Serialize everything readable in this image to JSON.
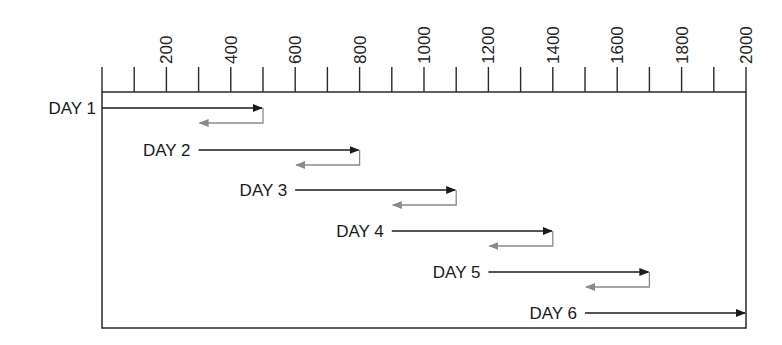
{
  "axis": {
    "min": 0,
    "max": 2000,
    "minor_step": 100,
    "labels": [
      "200",
      "400",
      "600",
      "800",
      "1000",
      "1200",
      "1400",
      "1600",
      "1800",
      "2000"
    ],
    "label_values": [
      200,
      400,
      600,
      800,
      1000,
      1200,
      1400,
      1600,
      1800,
      2000
    ]
  },
  "colors": {
    "frame": "#2a2a2a",
    "forward_arrow": "#1a1a1a",
    "return_arrow": "#8a8a8a",
    "text": "#1a1a1a"
  },
  "days": [
    {
      "label": "DAY 1",
      "start": 0,
      "end": 500,
      "return_to": 300
    },
    {
      "label": "DAY 2",
      "start": 300,
      "end": 800,
      "return_to": 600
    },
    {
      "label": "DAY 3",
      "start": 600,
      "end": 1100,
      "return_to": 900
    },
    {
      "label": "DAY 4",
      "start": 900,
      "end": 1400,
      "return_to": 1200
    },
    {
      "label": "DAY 5",
      "start": 1200,
      "end": 1700,
      "return_to": 1500
    },
    {
      "label": "DAY 6",
      "start": 1500,
      "end": 2000,
      "return_to": null
    }
  ]
}
